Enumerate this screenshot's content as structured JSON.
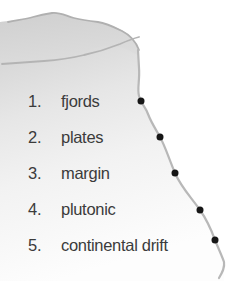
{
  "figure": {
    "name": "coastline-terms-diagram",
    "width": 236,
    "height": 281,
    "background_color": "#ffffff"
  },
  "map": {
    "landmass_label": "shaded-landmass",
    "land_fill_top": "#d2d2d2",
    "land_fill_bottom": "#fbfbfb",
    "contour_color": "#b0b0b0",
    "coastline_color": "#b8b8b8",
    "coastline_width": 2.2,
    "dot_color": "#161616",
    "dot_radius": 3.5,
    "coastline_path": "M 138 50 L 139 68 C 140 80 137 88 139 96 C 141 104 145 106 148 114 C 151 122 155 128 160 137 C 165 146 168 156 175 173 C 181 187 190 196 200 210 C 207 220 211 229 215 240 C 219 250 222 256 224 262 C 225 268 222 273 219 278",
    "contour_paths": [
      "M 8 22 C 18 20 26 19 33 17 C 40 15 45 14 52 13 C 60 12 66 16 74 18 C 82 20 90 21 98 22 C 106 23 114 27 122 31 C 130 35 136 42 139 50",
      "M 10 62 C 24 60 38 58 52 57 C 68 56 80 55 92 53 C 104 51 114 47 124 44 C 131 42 136 40 139 38"
    ],
    "dots": [
      {
        "name": "coast-dot-1",
        "x": 141,
        "y": 101
      },
      {
        "name": "coast-dot-2",
        "x": 160,
        "y": 137
      },
      {
        "name": "coast-dot-3",
        "x": 175,
        "y": 173
      },
      {
        "name": "coast-dot-4",
        "x": 200,
        "y": 210
      },
      {
        "name": "coast-dot-5",
        "x": 215,
        "y": 240
      }
    ]
  },
  "list": {
    "text_color": "#3b3b3b",
    "items": [
      {
        "number": "1.",
        "label": "fjords",
        "y": 101
      },
      {
        "number": "2.",
        "label": "plates",
        "y": 137
      },
      {
        "number": "3.",
        "label": "margin",
        "y": 173
      },
      {
        "number": "4.",
        "label": "plutonic",
        "y": 209
      },
      {
        "number": "5.",
        "label": "continental drift",
        "y": 245
      }
    ]
  }
}
